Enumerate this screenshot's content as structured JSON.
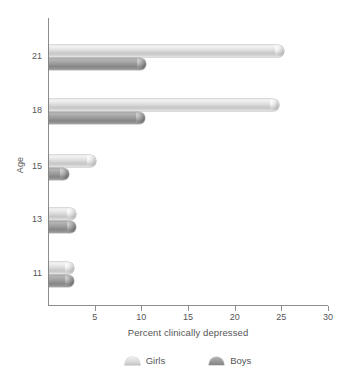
{
  "chart_data": {
    "type": "bar",
    "orientation": "horizontal",
    "title": "",
    "xlabel": "Percent clinically depressed",
    "ylabel": "Age",
    "categories": [
      "11",
      "13",
      "15",
      "18",
      "21"
    ],
    "series": [
      {
        "name": "Girls",
        "color": "#dcdcdc",
        "values": [
          2.7,
          2.9,
          5.0,
          24.6,
          25.2
        ]
      },
      {
        "name": "Boys",
        "color": "#9a9a9a",
        "values": [
          2.7,
          2.9,
          2.1,
          10.3,
          10.4
        ]
      }
    ],
    "xlim": [
      0,
      30
    ],
    "xticks": [
      5,
      10,
      15,
      20,
      25,
      30
    ],
    "xtick_labels": [
      "5",
      "10",
      "15",
      "20",
      "25",
      "30"
    ],
    "grid": false,
    "legend_position": "bottom"
  },
  "axes": {
    "y_title": "Age",
    "x_title": "Percent clinically depressed"
  },
  "legend": {
    "items": [
      {
        "label": "Girls",
        "swatch": "girls-swatch-icon"
      },
      {
        "label": "Boys",
        "swatch": "boys-swatch-icon"
      }
    ]
  }
}
